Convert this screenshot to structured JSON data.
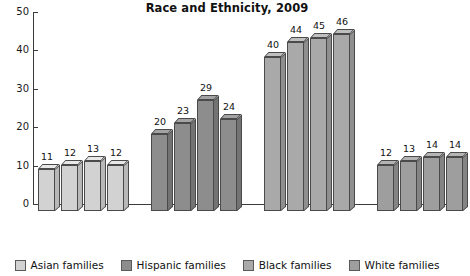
{
  "chart_data": {
    "type": "bar",
    "title": "Race and Ethnicity, 2009",
    "xlabel": "",
    "ylabel": "",
    "ylim": [
      0,
      50
    ],
    "yticks": [
      0,
      10,
      20,
      30,
      40,
      50
    ],
    "grid": false,
    "legend_position": "bottom",
    "categories": [
      "1980",
      "1990",
      "2000",
      "2008"
    ],
    "series": [
      {
        "name": "Asian families",
        "values": [
          11,
          12,
          13,
          12
        ],
        "color": "#d2d2d2"
      },
      {
        "name": "Hispanic families",
        "values": [
          20,
          23,
          29,
          24
        ],
        "color": "#8d8d8d"
      },
      {
        "name": "Black families",
        "values": [
          40,
          44,
          45,
          46
        ],
        "color": "#a9a9a9"
      },
      {
        "name": "White families",
        "values": [
          12,
          13,
          14,
          14
        ],
        "color": "#9e9e9e"
      }
    ]
  },
  "legend": {
    "items": [
      {
        "label": "Asian families",
        "color": "#d2d2d2"
      },
      {
        "label": "Hispanic families",
        "color": "#8d8d8d"
      },
      {
        "label": "Black families",
        "color": "#a9a9a9"
      },
      {
        "label": "White families",
        "color": "#9e9e9e"
      }
    ]
  }
}
